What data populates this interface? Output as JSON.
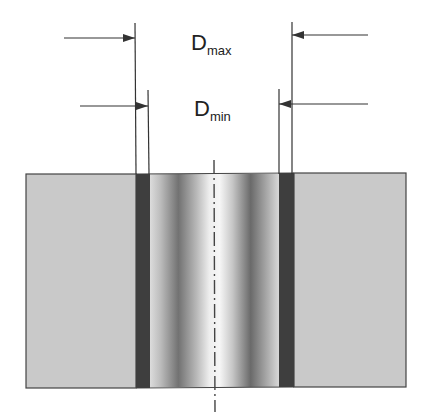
{
  "diagram": {
    "labels": {
      "dmax": {
        "main": "D",
        "sub": "max"
      },
      "dmin": {
        "main": "D",
        "sub": "min"
      }
    },
    "colors": {
      "background": "#ffffff",
      "block_fill": "#c8c8c8",
      "block_stroke": "#444444",
      "dark_band": "#3e3e3e",
      "line": "#333333",
      "bore_light": "#f2f2f2",
      "bore_dark": "#6e6e6e"
    },
    "elements": [
      "block",
      "left-coating-band",
      "right-coating-band",
      "central-bore",
      "centerline",
      "dmax-dimension",
      "dmin-dimension"
    ]
  }
}
